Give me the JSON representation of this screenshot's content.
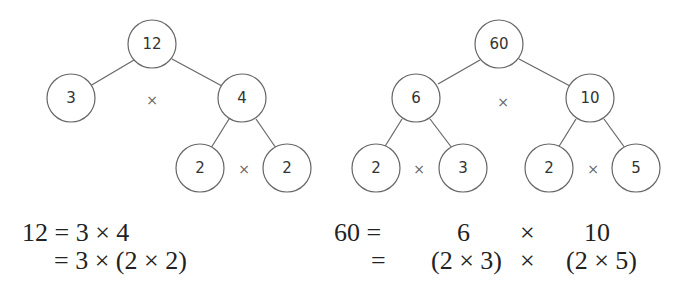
{
  "heading_partial": "...into its prime factors",
  "tree_left": {
    "root": "12",
    "level1": [
      "3",
      "4"
    ],
    "level2": [
      "2",
      "2"
    ],
    "operator": "×"
  },
  "tree_right": {
    "root": "60",
    "level1": [
      "6",
      "10"
    ],
    "level2": [
      "2",
      "3",
      "2",
      "5"
    ],
    "operator": "×"
  },
  "equations_left": {
    "line1": "12 = 3 × 4",
    "line2": "= 3 × (2 × 2)"
  },
  "equations_right": {
    "line1_lhs": "60 =",
    "line1_a": "6",
    "line1_op": "×",
    "line1_b": "10",
    "line2_lhs": "=",
    "line2_a": "(2 × 3)",
    "line2_op": "×",
    "line2_b": "(2 × 5)"
  }
}
